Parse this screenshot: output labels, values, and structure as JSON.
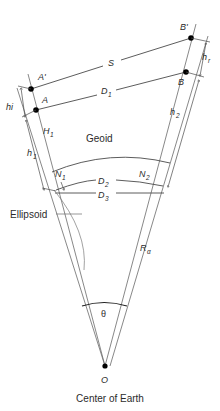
{
  "figure": {
    "type": "geodesy-distance-reduction-diagram",
    "caption": "Center of Earth",
    "background_color": "#ffffff",
    "line_color": "#4a4a4a",
    "text_color": "#2b2b2b",
    "point_color": "#000000"
  },
  "points": [
    {
      "id": "A-prime",
      "label": "A'",
      "x": 31,
      "y": 89,
      "label_x": 38,
      "label_y": 80
    },
    {
      "id": "A",
      "label": "A",
      "x": 36,
      "y": 110,
      "label_x": 42,
      "label_y": 103
    },
    {
      "id": "B-prime",
      "label": "B'",
      "x": 191,
      "y": 38,
      "label_x": 181,
      "label_y": 30
    },
    {
      "id": "B",
      "label": "B",
      "x": 186,
      "y": 72,
      "label_x": 179,
      "label_y": 84
    },
    {
      "id": "O",
      "label": "O",
      "x": 105,
      "y": 366,
      "label_x": 105,
      "label_y": 381
    }
  ],
  "measures": {
    "slope_distance": {
      "symbol": "S",
      "x": 112,
      "y": 63,
      "description": "slope distance A' to B'"
    },
    "horizontal_distance_1": {
      "symbol": "D",
      "subscript": "1",
      "x": 106,
      "y": 92,
      "description": "distance A to B"
    },
    "instrument_height": {
      "symbol": "hi",
      "x": 11,
      "y": 108,
      "description": "instrument height at A"
    },
    "reflector_height": {
      "symbol": "h",
      "subscript": "r",
      "x": 205,
      "y": 60,
      "description": "reflector height at B"
    },
    "ellipsoid_height_1": {
      "symbol": "h",
      "subscript": "1",
      "x": 31,
      "y": 155,
      "description": "ellipsoidal height at station 1"
    },
    "ellipsoid_height_2": {
      "symbol": "h",
      "subscript": "2",
      "x": 173,
      "y": 115,
      "description": "ellipsoidal height at station 2"
    },
    "orthometric_height_1": {
      "symbol": "H",
      "subscript": "1",
      "x": 47,
      "y": 134,
      "description": "orthometric height at station 1"
    },
    "geoid_undulation_1": {
      "symbol": "N",
      "subscript": "1",
      "x": 59,
      "y": 176,
      "description": "geoid undulation at station 1"
    },
    "geoid_undulation_2": {
      "symbol": "N",
      "subscript": "2",
      "x": 143,
      "y": 176,
      "description": "geoid undulation at station 2"
    },
    "geoid_distance": {
      "symbol": "D",
      "subscript": "2",
      "x": 103,
      "y": 184,
      "description": "geoid level distance"
    },
    "ellipsoid_distance": {
      "symbol": "D",
      "subscript": "3",
      "x": 103,
      "y": 196,
      "description": "ellipsoid level distance"
    },
    "earth_radius": {
      "symbol": "R",
      "subscript": "α",
      "x": 144,
      "y": 251,
      "description": "radius of earth"
    },
    "central_angle": {
      "symbol": "θ",
      "x": 104,
      "y": 314,
      "description": "central angle at earth center"
    }
  },
  "surfaces": {
    "geoid": {
      "label": "Geoid",
      "x": 105,
      "y": 139
    },
    "ellipsoid": {
      "label": "Ellipsoid",
      "x": 12,
      "y": 217
    }
  },
  "caption": {
    "text": "Center of Earth",
    "x": 110,
    "y": 400
  }
}
